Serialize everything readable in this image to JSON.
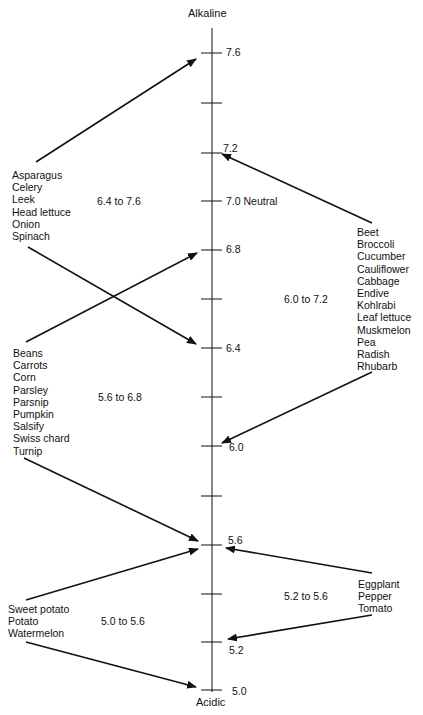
{
  "axis": {
    "top_label": "Alkaline",
    "bottom_label": "Acidic",
    "neutral_label": "Neutral",
    "ticks": [
      {
        "value": "7.6",
        "labeled": true
      },
      {
        "value": "7.4",
        "labeled": false
      },
      {
        "value": "7.2",
        "labeled": true
      },
      {
        "value": "7.0",
        "labeled": true
      },
      {
        "value": "6.8",
        "labeled": true
      },
      {
        "value": "6.6",
        "labeled": false
      },
      {
        "value": "6.4",
        "labeled": true
      },
      {
        "value": "6.2",
        "labeled": false
      },
      {
        "value": "6.0",
        "labeled": true
      },
      {
        "value": "5.8",
        "labeled": false
      },
      {
        "value": "5.6",
        "labeled": true
      },
      {
        "value": "5.4",
        "labeled": false
      },
      {
        "value": "5.2",
        "labeled": true
      },
      {
        "value": "5.0",
        "labeled": true
      }
    ]
  },
  "groups": {
    "g1": {
      "range": "6.4 to 7.6",
      "items": [
        "Asparagus",
        "Celery",
        "Leek",
        "Head lettuce",
        "Onion",
        "Spinach"
      ]
    },
    "g2": {
      "range": "6.0 to 7.2",
      "items": [
        "Beet",
        "Broccoli",
        "Cucumber",
        "Cauliflower",
        "Cabbage",
        "Endive",
        "Kohlrabi",
        "Leaf lettuce",
        "Muskmelon",
        "Pea",
        "Radish",
        "Rhubarb"
      ]
    },
    "g3": {
      "range": "5.6 to 6.8",
      "items": [
        "Beans",
        "Carrots",
        "Corn",
        "Parsley",
        "Parsnip",
        "Pumpkin",
        "Salsify",
        "Swiss chard",
        "Turnip"
      ]
    },
    "g4": {
      "range": "5.2 to 5.6",
      "items": [
        "Eggplant",
        "Pepper",
        "Tomato"
      ]
    },
    "g5": {
      "range": "5.0 to 5.6",
      "items": [
        "Sweet potato",
        "Potato",
        "Watermelon"
      ]
    }
  },
  "colors": {
    "ink": "#111111",
    "background": "#ffffff"
  }
}
